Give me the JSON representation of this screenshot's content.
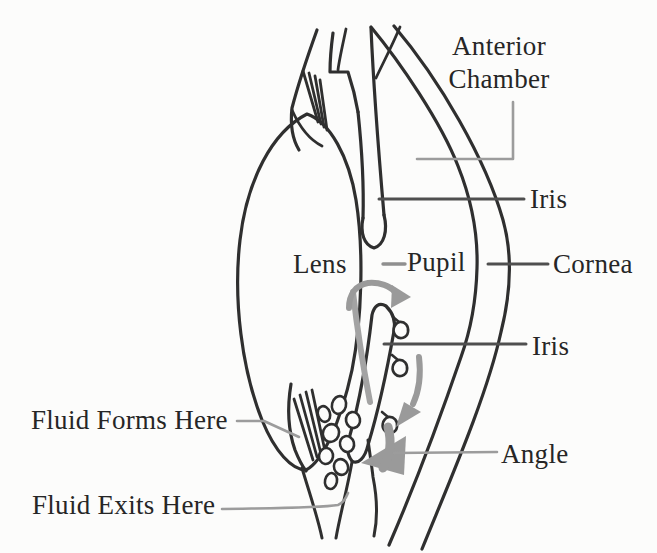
{
  "figure": {
    "background_color": "#fcfcfb",
    "ink_color": "#2f2f2f",
    "leader_dark_color": "#4f4f4f",
    "leader_light_color": "#9c9c9c",
    "flow_arrow_color": "#9a9a9a"
  },
  "labels": {
    "anterior_chamber": "Anterior Chamber",
    "iris_upper": "Iris",
    "lens": "Lens",
    "pupil": "Pupil",
    "cornea": "Cornea",
    "iris_lower": "Iris",
    "angle": "Angle",
    "fluid_forms": "Fluid Forms Here",
    "fluid_exits": "Fluid Exits Here"
  }
}
